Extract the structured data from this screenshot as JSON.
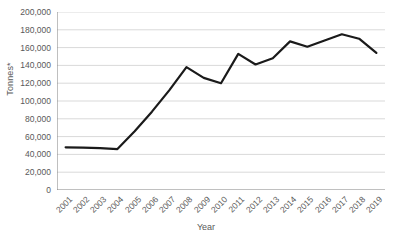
{
  "chart_data": {
    "type": "line",
    "title": "",
    "xlabel": "Year",
    "ylabel": "Tonnes*",
    "categories": [
      "2001",
      "2002",
      "2003",
      "2004",
      "2005",
      "2006",
      "2007",
      "2008",
      "2009",
      "2010",
      "2011",
      "2012",
      "2013",
      "2014",
      "2015",
      "2016",
      "2017",
      "2018",
      "2019"
    ],
    "values": [
      48000,
      47500,
      47000,
      46000,
      66000,
      88000,
      112000,
      138000,
      126000,
      120000,
      153000,
      141000,
      148000,
      167000,
      161000,
      168000,
      175000,
      170000,
      154000
    ],
    "series": [
      {
        "name": "Tonnes",
        "values": [
          48000,
          47500,
          47000,
          46000,
          66000,
          88000,
          112000,
          138000,
          126000,
          120000,
          153000,
          141000,
          148000,
          167000,
          161000,
          168000,
          175000,
          170000,
          154000
        ]
      }
    ],
    "ylim": [
      0,
      200000
    ],
    "y_ticks": [
      0,
      20000,
      40000,
      60000,
      80000,
      100000,
      120000,
      140000,
      160000,
      180000,
      200000
    ],
    "y_tick_labels": [
      "0",
      "20,000",
      "40,000",
      "60,000",
      "80,000",
      "100,000",
      "120,000",
      "140,000",
      "160,000",
      "180,000",
      "200,000"
    ],
    "grid": true,
    "grid_axis": "y",
    "legend": "none",
    "line_color": "#1a1a1a",
    "grid_color": "#d9d9d9",
    "axis_color": "#808080",
    "text_color": "#595959",
    "markers": "none",
    "line_width": 2.2
  },
  "axis_titles": {
    "y": "Tonnes*",
    "x": "Year"
  }
}
